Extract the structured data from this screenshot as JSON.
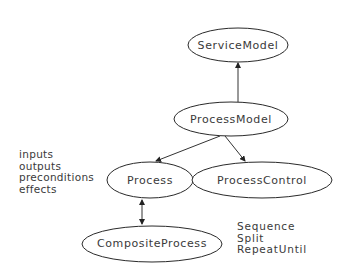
{
  "diagram": {
    "nodes": [
      {
        "id": "service-model",
        "label": "ServiceModel",
        "cx": 238,
        "cy": 45,
        "rx": 50,
        "ry": 17
      },
      {
        "id": "process-model",
        "label": "ProcessModel",
        "cx": 231,
        "cy": 119,
        "rx": 57,
        "ry": 17
      },
      {
        "id": "process",
        "label": "Process",
        "cx": 150,
        "cy": 180,
        "rx": 43,
        "ry": 18
      },
      {
        "id": "process-control",
        "label": "ProcessControl",
        "cx": 262,
        "cy": 180,
        "rx": 70,
        "ry": 18
      },
      {
        "id": "composite-process",
        "label": "CompositeProcess",
        "cx": 152,
        "cy": 244,
        "rx": 70,
        "ry": 18
      }
    ],
    "edges": [
      {
        "from": "process-model",
        "to": "service-model",
        "type": "arrow"
      },
      {
        "from": "process-model",
        "to": "process",
        "type": "arrow"
      },
      {
        "from": "process-model",
        "to": "process-control",
        "type": "arrow"
      },
      {
        "from": "process",
        "to": "composite-process",
        "type": "bidirectional-arrow"
      }
    ],
    "process_attributes": [
      "inputs",
      "outputs",
      "preconditions",
      "effects"
    ],
    "control_constructs": [
      "Sequence",
      "Split",
      "RepeatUntil"
    ],
    "colors": {
      "stroke": "#2a2a2a",
      "text": "#3a3a3a",
      "background": "#ffffff"
    }
  }
}
